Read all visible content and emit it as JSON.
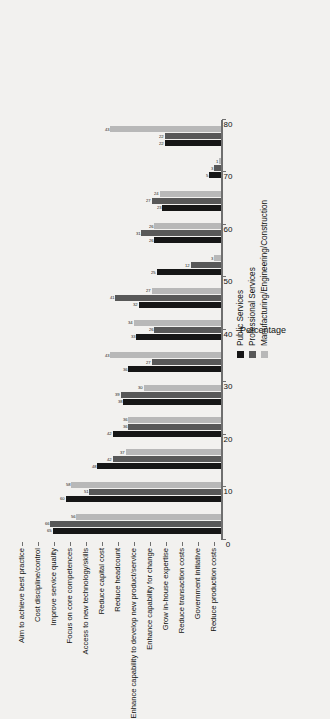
{
  "chart_data": {
    "type": "bar",
    "title": "",
    "xlabel": "",
    "ylabel": "Percentage",
    "ylim": [
      0,
      80
    ],
    "ticks": [
      0,
      10,
      20,
      30,
      40,
      50,
      60,
      70,
      80
    ],
    "grid": false,
    "orientation": "vertical-rotated",
    "legend_position": "center-right",
    "categories": [
      "Aim to achieve best practice",
      "Cost discipline/control",
      "Improve service quality",
      "Focus on core competences",
      "Access to new technology/skills",
      "Reduce capital cost",
      "Reduce headcount",
      "Enhance capability to develop new product/service",
      "Enhance capability for change",
      "Grow in-house expertise",
      "Reduce transaction costs",
      "Government initiative",
      "Reduce production costs"
    ],
    "series": [
      {
        "name": "Public Services",
        "color": "#161616",
        "values": [
          65,
          60,
          48,
          42,
          38,
          36,
          33,
          32,
          25,
          26,
          23,
          5,
          22
        ]
      },
      {
        "name": "Professional Services",
        "color": "#585858",
        "values": [
          66,
          51,
          42,
          36,
          39,
          27,
          26,
          41,
          12,
          31,
          27,
          3,
          22
        ]
      },
      {
        "name": "Manufacturing/Engineering/Construction",
        "color": "#b8b8b8",
        "values": [
          56,
          58,
          37,
          36,
          30,
          43,
          34,
          27,
          3,
          26,
          24,
          1,
          43
        ]
      }
    ]
  },
  "legend": {
    "items": [
      {
        "label": "Public Services",
        "color": "#161616"
      },
      {
        "label": "Professional Services",
        "color": "#585858"
      },
      {
        "label": "Manufacturing/Engineering/Construction",
        "color": "#b8b8b8"
      }
    ]
  },
  "axis": {
    "value_title": "Percentage",
    "tick_labels": [
      "0",
      "10",
      "20",
      "30",
      "40",
      "50",
      "60",
      "70",
      "80"
    ]
  }
}
